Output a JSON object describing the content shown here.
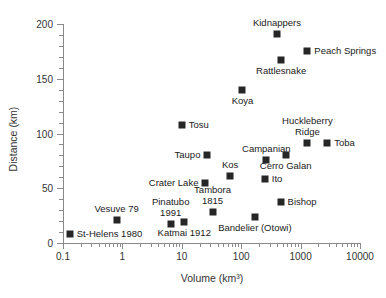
{
  "chart_data": {
    "type": "scatter",
    "title": "",
    "xlabel": "Volume (km³)",
    "ylabel": "Distance (km)",
    "xscale": "log",
    "yscale": "linear",
    "xlim": [
      0.1,
      10000
    ],
    "ylim": [
      0,
      200
    ],
    "grid": false,
    "legend": "none",
    "xticks": [
      "0.1",
      "1",
      "10",
      "100",
      "1000",
      "10000"
    ],
    "xtick_values": [
      0.1,
      1,
      10,
      100,
      1000,
      10000
    ],
    "yticks": [
      "0",
      "50",
      "100",
      "150",
      "200"
    ],
    "ytick_values": [
      0,
      50,
      100,
      150,
      200
    ],
    "points": [
      {
        "label": "St-Helens 1980",
        "x": 0.13,
        "y": 8,
        "label_pos": "right"
      },
      {
        "label": "Vesuve 79",
        "x": 0.8,
        "y": 21,
        "label_pos": "above"
      },
      {
        "label": "Pinatubo\n1991",
        "x": 6.5,
        "y": 17,
        "label_pos": "above"
      },
      {
        "label": "Katmai 1912",
        "x": 11,
        "y": 19,
        "label_pos": "below"
      },
      {
        "label": "Crater Lake",
        "x": 25,
        "y": 55,
        "label_pos": "left"
      },
      {
        "label": "Taupo",
        "x": 27,
        "y": 80,
        "label_pos": "left"
      },
      {
        "label": "Tambora\n1815",
        "x": 33,
        "y": 28,
        "label_pos": "above"
      },
      {
        "label": "Kos",
        "x": 65,
        "y": 61,
        "label_pos": "above"
      },
      {
        "label": "Tosu",
        "x": 10,
        "y": 108,
        "label_pos": "right"
      },
      {
        "label": "Koya",
        "x": 105,
        "y": 140,
        "label_pos": "below"
      },
      {
        "label": "Bandelier (Otowi)",
        "x": 170,
        "y": 24,
        "label_pos": "below"
      },
      {
        "label": "Ito",
        "x": 250,
        "y": 58,
        "label_pos": "right"
      },
      {
        "label": "Campanian",
        "x": 265,
        "y": 76,
        "label_pos": "above"
      },
      {
        "label": "Bishop",
        "x": 460,
        "y": 37,
        "label_pos": "right"
      },
      {
        "label": "Cerro Galan",
        "x": 560,
        "y": 80,
        "label_pos": "below"
      },
      {
        "label": "Kidnappers",
        "x": 400,
        "y": 191,
        "label_pos": "above"
      },
      {
        "label": "Rattlesnake",
        "x": 470,
        "y": 167,
        "label_pos": "below"
      },
      {
        "label": "Huckleberry\nRidge",
        "x": 1300,
        "y": 91,
        "label_pos": "above"
      },
      {
        "label": "Peach Springs",
        "x": 1300,
        "y": 175,
        "label_pos": "right"
      },
      {
        "label": "Toba",
        "x": 2800,
        "y": 91,
        "label_pos": "right"
      }
    ]
  },
  "colors": {
    "marker": "#262626",
    "axis": "#8a8a8a",
    "text": "#1a1a1a",
    "background": "#ffffff"
  }
}
